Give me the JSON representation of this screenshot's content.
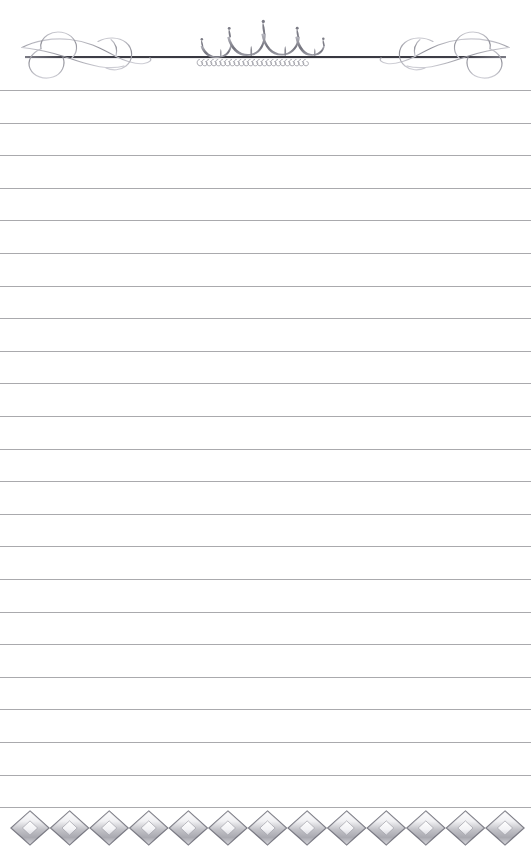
{
  "page": {
    "kind": "ruled-stationery-page",
    "width": 531,
    "height": 864,
    "background_color": "#ffffff",
    "has_text": false,
    "text_content": ""
  },
  "header": {
    "ornament_name": "crown-flourish-divider",
    "rule": {
      "color": "#4a4a52",
      "x_start": 25,
      "x_end": 506,
      "y": 57,
      "thickness": 2
    },
    "left_flourish": {
      "name": "left-swirl-flourish",
      "color": "#a8a8ae"
    },
    "right_flourish": {
      "name": "right-swirl-flourish",
      "color": "#a8a8ae"
    },
    "crown": {
      "name": "crown-ornament",
      "color": "#8e8e96",
      "points": 4,
      "center_x": 255,
      "pearl_count": 24,
      "pearl_color": "#9a9aa2"
    }
  },
  "body": {
    "name": "ruled-writing-area",
    "line_color": "#9b9b9f",
    "line_thickness": 1,
    "line_spacing": 32.6,
    "first_line_y": 90,
    "line_count": 23,
    "line_x_start": 0,
    "line_x_end": 531,
    "line_y_positions": [
      90,
      122.6,
      155.2,
      187.8,
      220.4,
      253,
      285.6,
      318.2,
      350.8,
      383.4,
      416,
      448.6,
      481.2,
      513.8,
      546.4,
      579,
      611.6,
      644.2,
      676.8,
      709.4,
      742,
      774.6,
      807.2
    ]
  },
  "footer": {
    "ornament_name": "four-point-star-chain-border",
    "description": "Repeating chain of four-pointed concave stars forming a decorative bottom rule",
    "star_count": 13,
    "star_color_light": "#e8e8ec",
    "star_color_dark": "#6f6f78",
    "x_start": 30,
    "x_end": 505,
    "center_y": 835,
    "star_width": 38,
    "star_height": 34
  },
  "colors": {
    "paper": "#ffffff",
    "rule_gray": "#9b9b9f",
    "ornament_gray": "#8e8e96",
    "ornament_dark": "#4a4a52",
    "ornament_light": "#dcdce0"
  }
}
